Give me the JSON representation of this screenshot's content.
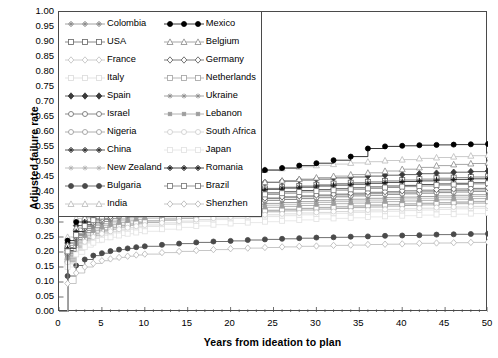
{
  "chart_data": {
    "type": "line",
    "title": "",
    "xlabel": "Years from ideation to plan",
    "ylabel": "Adjusted failure rate",
    "xlim": [
      0,
      50
    ],
    "ylim": [
      0,
      1.0
    ],
    "xticks": [
      0,
      5,
      10,
      15,
      20,
      25,
      30,
      35,
      40,
      45,
      50
    ],
    "yticks": [
      "0.00",
      "0.05",
      "0.10",
      "0.15",
      "0.20",
      "0.25",
      "0.30",
      "0.35",
      "0.40",
      "0.45",
      "0.50",
      "0.55",
      "0.60",
      "0.65",
      "0.70",
      "0.75",
      "0.80",
      "0.85",
      "0.90",
      "0.95",
      "1.00"
    ],
    "x_minor_tick_step": 1,
    "grid": false,
    "legend_position": "upper-left-inside",
    "legend_columns": 2,
    "step_style": "step-post",
    "x": [
      0,
      1,
      2,
      3,
      4,
      5,
      6,
      7,
      8,
      9,
      10,
      12,
      14,
      16,
      18,
      20,
      22,
      24,
      26,
      28,
      30,
      32,
      34,
      36,
      38,
      40,
      42,
      44,
      46,
      48,
      50
    ],
    "series": [
      {
        "name": "Colombia",
        "marker": "plus",
        "color": "#8a8a8a",
        "fill": "none",
        "values": [
          0,
          0.2,
          0.255,
          0.285,
          0.3,
          0.312,
          0.32,
          0.326,
          0.332,
          0.337,
          0.342,
          0.35,
          0.356,
          0.362,
          0.366,
          0.37,
          0.374,
          0.378,
          0.381,
          0.384,
          0.387,
          0.39,
          0.392,
          0.395,
          0.397,
          0.399,
          0.401,
          0.403,
          0.405,
          0.407,
          0.409
        ]
      },
      {
        "name": "USA",
        "marker": "square",
        "color": "#6b6b6b",
        "fill": "none",
        "values": [
          0,
          0.215,
          0.268,
          0.3,
          0.318,
          0.33,
          0.34,
          0.348,
          0.355,
          0.361,
          0.366,
          0.376,
          0.384,
          0.391,
          0.397,
          0.402,
          0.407,
          0.412,
          0.416,
          0.42,
          0.424,
          0.428,
          0.431,
          0.434,
          0.437,
          0.44,
          0.443,
          0.446,
          0.448,
          0.45,
          0.452
        ]
      },
      {
        "name": "France",
        "marker": "diamond",
        "color": "#c2c2c2",
        "fill": "none",
        "values": [
          0,
          0.175,
          0.222,
          0.248,
          0.264,
          0.275,
          0.283,
          0.29,
          0.296,
          0.301,
          0.305,
          0.313,
          0.319,
          0.324,
          0.329,
          0.333,
          0.337,
          0.34,
          0.343,
          0.346,
          0.349,
          0.352,
          0.354,
          0.357,
          0.359,
          0.361,
          0.363,
          0.365,
          0.367,
          0.369,
          0.371
        ]
      },
      {
        "name": "Italy",
        "marker": "square",
        "color": "#dcdcdc",
        "fill": "none",
        "values": [
          0,
          0.16,
          0.205,
          0.23,
          0.245,
          0.256,
          0.264,
          0.271,
          0.276,
          0.281,
          0.285,
          0.292,
          0.298,
          0.303,
          0.308,
          0.312,
          0.315,
          0.318,
          0.321,
          0.324,
          0.327,
          0.329,
          0.332,
          0.334,
          0.336,
          0.338,
          0.34,
          0.342,
          0.344,
          0.346,
          0.348
        ]
      },
      {
        "name": "Spain",
        "marker": "diamond",
        "color": "#3a3a3a",
        "fill": "#3a3a3a",
        "values": [
          0,
          0.23,
          0.288,
          0.32,
          0.34,
          0.353,
          0.363,
          0.371,
          0.378,
          0.384,
          0.389,
          0.398,
          0.406,
          0.412,
          0.418,
          0.423,
          0.428,
          0.432,
          0.436,
          0.44,
          0.443,
          0.447,
          0.45,
          0.453,
          0.456,
          0.458,
          0.461,
          0.463,
          0.466,
          0.468,
          0.47
        ]
      },
      {
        "name": "Israel",
        "marker": "circle",
        "color": "#707070",
        "fill": "none",
        "values": [
          0,
          0.19,
          0.242,
          0.272,
          0.29,
          0.302,
          0.311,
          0.318,
          0.324,
          0.33,
          0.334,
          0.342,
          0.349,
          0.355,
          0.36,
          0.364,
          0.368,
          0.372,
          0.375,
          0.378,
          0.381,
          0.384,
          0.387,
          0.389,
          0.392,
          0.394,
          0.396,
          0.398,
          0.4,
          0.402,
          0.404
        ]
      },
      {
        "name": "Nigeria",
        "marker": "circle",
        "color": "#999999",
        "fill": "none",
        "values": [
          0,
          0.168,
          0.214,
          0.24,
          0.256,
          0.267,
          0.276,
          0.283,
          0.289,
          0.294,
          0.298,
          0.306,
          0.312,
          0.318,
          0.322,
          0.326,
          0.33,
          0.334,
          0.337,
          0.34,
          0.343,
          0.345,
          0.348,
          0.35,
          0.353,
          0.355,
          0.357,
          0.359,
          0.361,
          0.363,
          0.365
        ]
      },
      {
        "name": "China",
        "marker": "plus",
        "color": "#2e2e2e",
        "fill": "none",
        "values": [
          0,
          0.205,
          0.26,
          0.291,
          0.31,
          0.322,
          0.332,
          0.339,
          0.346,
          0.351,
          0.356,
          0.365,
          0.372,
          0.378,
          0.384,
          0.389,
          0.393,
          0.397,
          0.401,
          0.405,
          0.408,
          0.411,
          0.414,
          0.417,
          0.42,
          0.422,
          0.425,
          0.427,
          0.429,
          0.431,
          0.433
        ]
      },
      {
        "name": "New Zealand",
        "marker": "star",
        "color": "#b0b0b0",
        "fill": "none",
        "values": [
          0,
          0.182,
          0.232,
          0.26,
          0.277,
          0.288,
          0.297,
          0.304,
          0.31,
          0.315,
          0.319,
          0.327,
          0.334,
          0.339,
          0.344,
          0.348,
          0.352,
          0.356,
          0.359,
          0.362,
          0.365,
          0.368,
          0.37,
          0.373,
          0.375,
          0.377,
          0.379,
          0.381,
          0.383,
          0.385,
          0.387
        ]
      },
      {
        "name": "Bulgaria",
        "marker": "circle",
        "color": "#4a4a4a",
        "fill": "#4a4a4a",
        "values": [
          0,
          0.12,
          0.155,
          0.175,
          0.188,
          0.196,
          0.203,
          0.208,
          0.212,
          0.216,
          0.219,
          0.224,
          0.228,
          0.232,
          0.235,
          0.237,
          0.24,
          0.242,
          0.244,
          0.246,
          0.248,
          0.249,
          0.251,
          0.252,
          0.254,
          0.255,
          0.256,
          0.258,
          0.259,
          0.26,
          0.261
        ]
      },
      {
        "name": "India",
        "marker": "triangle",
        "color": "#bdbdbd",
        "fill": "none",
        "values": [
          0,
          0.25,
          0.312,
          0.348,
          0.37,
          0.385,
          0.396,
          0.405,
          0.413,
          0.419,
          0.425,
          0.435,
          0.443,
          0.45,
          0.457,
          0.463,
          0.469,
          0.474,
          0.479,
          0.484,
          0.489,
          0.493,
          0.497,
          0.501,
          0.505,
          0.508,
          0.512,
          0.515,
          0.518,
          0.521,
          0.524
        ]
      },
      {
        "name": "Mexico",
        "marker": "circle",
        "color": "#000000",
        "fill": "#000000",
        "values": [
          0,
          0.238,
          0.3,
          0.336,
          0.358,
          0.374,
          0.386,
          0.396,
          0.404,
          0.411,
          0.417,
          0.427,
          0.436,
          0.444,
          0.452,
          0.459,
          0.466,
          0.473,
          0.48,
          0.488,
          0.496,
          0.506,
          0.518,
          0.545,
          0.552,
          0.554,
          0.556,
          0.557,
          0.558,
          0.559,
          0.56
        ]
      },
      {
        "name": "Belgium",
        "marker": "triangle",
        "color": "#8f8f8f",
        "fill": "none",
        "values": [
          0,
          0.222,
          0.28,
          0.314,
          0.334,
          0.348,
          0.359,
          0.367,
          0.375,
          0.381,
          0.386,
          0.396,
          0.404,
          0.411,
          0.417,
          0.423,
          0.428,
          0.433,
          0.438,
          0.443,
          0.448,
          0.453,
          0.458,
          0.464,
          0.47,
          0.476,
          0.482,
          0.488,
          0.492,
          0.495,
          0.498
        ]
      },
      {
        "name": "Germany",
        "marker": "diamond",
        "color": "#5c5c5c",
        "fill": "none",
        "values": [
          0,
          0.196,
          0.249,
          0.279,
          0.297,
          0.309,
          0.318,
          0.326,
          0.332,
          0.337,
          0.342,
          0.35,
          0.357,
          0.363,
          0.368,
          0.372,
          0.377,
          0.38,
          0.384,
          0.387,
          0.39,
          0.393,
          0.396,
          0.399,
          0.401,
          0.404,
          0.406,
          0.408,
          0.41,
          0.412,
          0.414
        ]
      },
      {
        "name": "Netherlands",
        "marker": "square",
        "color": "#a5a5a5",
        "fill": "none",
        "values": [
          0,
          0.172,
          0.219,
          0.245,
          0.261,
          0.272,
          0.281,
          0.288,
          0.293,
          0.298,
          0.303,
          0.31,
          0.317,
          0.322,
          0.327,
          0.331,
          0.335,
          0.338,
          0.342,
          0.345,
          0.348,
          0.35,
          0.353,
          0.356,
          0.358,
          0.36,
          0.362,
          0.364,
          0.366,
          0.368,
          0.37
        ]
      },
      {
        "name": "Ukraine",
        "marker": "star",
        "color": "#8a8a8a",
        "fill": "none",
        "values": [
          0,
          0.186,
          0.237,
          0.265,
          0.282,
          0.294,
          0.303,
          0.31,
          0.316,
          0.321,
          0.325,
          0.333,
          0.34,
          0.345,
          0.35,
          0.354,
          0.358,
          0.362,
          0.365,
          0.368,
          0.371,
          0.374,
          0.376,
          0.379,
          0.381,
          0.383,
          0.385,
          0.387,
          0.389,
          0.391,
          0.393
        ]
      },
      {
        "name": "Lebanon",
        "marker": "smallsquare",
        "color": "#9e9e9e",
        "fill": "#9e9e9e",
        "values": [
          0,
          0.178,
          0.227,
          0.254,
          0.271,
          0.282,
          0.291,
          0.298,
          0.304,
          0.309,
          0.313,
          0.321,
          0.327,
          0.333,
          0.337,
          0.342,
          0.345,
          0.349,
          0.352,
          0.355,
          0.358,
          0.361,
          0.363,
          0.366,
          0.368,
          0.37,
          0.372,
          0.374,
          0.376,
          0.378,
          0.38
        ]
      },
      {
        "name": "South Africa",
        "marker": "circle",
        "color": "#cfcfcf",
        "fill": "none",
        "values": [
          0,
          0.164,
          0.209,
          0.234,
          0.25,
          0.261,
          0.269,
          0.276,
          0.281,
          0.286,
          0.29,
          0.297,
          0.303,
          0.308,
          0.313,
          0.317,
          0.32,
          0.324,
          0.327,
          0.33,
          0.332,
          0.335,
          0.337,
          0.34,
          0.342,
          0.344,
          0.346,
          0.348,
          0.35,
          0.352,
          0.353
        ]
      },
      {
        "name": "Japan",
        "marker": "square",
        "color": "#e2e2e2",
        "fill": "none",
        "values": [
          0,
          0.15,
          0.192,
          0.216,
          0.231,
          0.241,
          0.249,
          0.255,
          0.261,
          0.265,
          0.269,
          0.276,
          0.282,
          0.287,
          0.291,
          0.295,
          0.298,
          0.301,
          0.304,
          0.307,
          0.31,
          0.312,
          0.314,
          0.317,
          0.319,
          0.321,
          0.323,
          0.325,
          0.326,
          0.328,
          0.33
        ]
      },
      {
        "name": "Romania",
        "marker": "plus",
        "color": "#1a1a1a",
        "fill": "none",
        "values": [
          0,
          0.212,
          0.268,
          0.3,
          0.319,
          0.332,
          0.342,
          0.35,
          0.357,
          0.362,
          0.367,
          0.376,
          0.383,
          0.39,
          0.395,
          0.4,
          0.405,
          0.409,
          0.413,
          0.416,
          0.42,
          0.423,
          0.426,
          0.429,
          0.432,
          0.435,
          0.437,
          0.44,
          0.442,
          0.444,
          0.446
        ]
      },
      {
        "name": "Brazil",
        "marker": "square",
        "color": "#7a7a7a",
        "fill": "none",
        "values": [
          0,
          0.202,
          0.257,
          0.287,
          0.306,
          0.318,
          0.328,
          0.335,
          0.342,
          0.347,
          0.352,
          0.36,
          0.367,
          0.374,
          0.379,
          0.384,
          0.388,
          0.392,
          0.396,
          0.4,
          0.403,
          0.406,
          0.409,
          0.412,
          0.415,
          0.418,
          0.42,
          0.423,
          0.425,
          0.427,
          0.429
        ]
      },
      {
        "name": "Shenzhen",
        "marker": "diamond",
        "color": "#b8b8b8",
        "fill": "none",
        "values": [
          0,
          0.095,
          0.13,
          0.15,
          0.162,
          0.171,
          0.177,
          0.182,
          0.186,
          0.19,
          0.193,
          0.198,
          0.202,
          0.205,
          0.208,
          0.211,
          0.213,
          0.215,
          0.217,
          0.219,
          0.22,
          0.222,
          0.223,
          0.225,
          0.226,
          0.227,
          0.229,
          0.23,
          0.231,
          0.232,
          0.233
        ]
      }
    ]
  },
  "legend": {
    "rows": [
      {
        "left": "Colombia",
        "right": "Mexico"
      },
      {
        "left": "USA",
        "right": "Belgium"
      },
      {
        "left": "France",
        "right": "Germany"
      },
      {
        "left": "Italy",
        "right": "Netherlands"
      },
      {
        "left": "Spain",
        "right": "Ukraine"
      },
      {
        "left": "Israel",
        "right": "Lebanon"
      },
      {
        "left": "Nigeria",
        "right": "South Africa"
      },
      {
        "left": "China",
        "right": "Japan"
      },
      {
        "left": "New Zealand",
        "right": "Romania"
      },
      {
        "left": "Bulgaria",
        "right": "Brazil"
      },
      {
        "left": "India",
        "right": "Shenzhen"
      }
    ]
  }
}
